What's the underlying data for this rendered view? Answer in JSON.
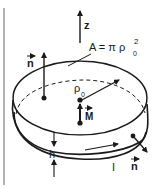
{
  "figure": {
    "labels": {
      "z_axis": "z",
      "area": "A = π ρ",
      "area_sub": "0",
      "area_sup": "2",
      "normal_top": "n",
      "radius": "ρ",
      "radius_sub": "0",
      "moment": "M",
      "height": "h",
      "current": "I",
      "normal_side": "n"
    },
    "colors": {
      "ink": "#1a1a1a",
      "border": "#9a9a9a",
      "background": "#ffffff"
    }
  }
}
